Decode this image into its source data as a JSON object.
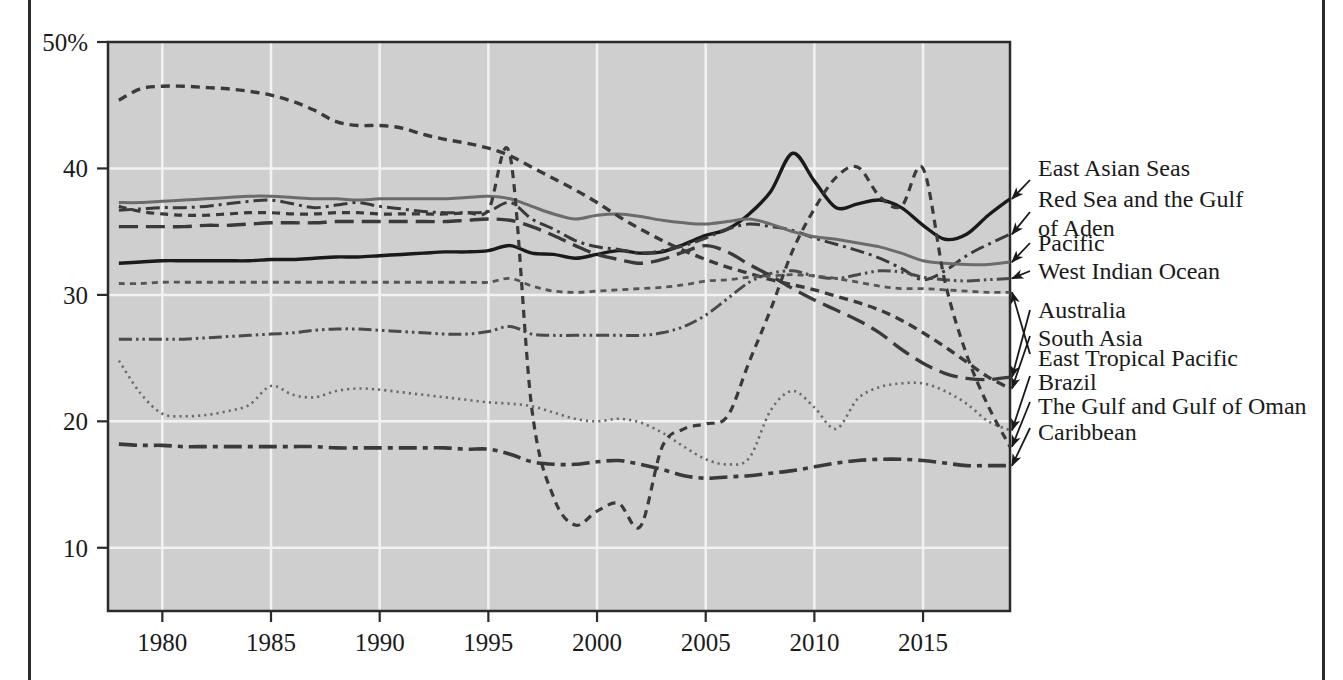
{
  "chart_data": {
    "type": "line",
    "title": "",
    "xlabel": "",
    "ylabel": "",
    "xlim": [
      1977.5,
      2019.0
    ],
    "ylim": [
      5.0,
      50.0
    ],
    "grid": true,
    "legend_position": "right-labels-with-arrows",
    "y_ticks": [
      {
        "value": 50,
        "label": "50%"
      },
      {
        "value": 40,
        "label": "40"
      },
      {
        "value": 30,
        "label": "30"
      },
      {
        "value": 20,
        "label": "20"
      },
      {
        "value": 10,
        "label": "10"
      }
    ],
    "x_ticks": [
      {
        "value": 1980,
        "label": "1980"
      },
      {
        "value": 1985,
        "label": "1985"
      },
      {
        "value": 1990,
        "label": "1990"
      },
      {
        "value": 1995,
        "label": "1995"
      },
      {
        "value": 2000,
        "label": "2000"
      },
      {
        "value": 2005,
        "label": "2005"
      },
      {
        "value": 2010,
        "label": "2010"
      },
      {
        "value": 2015,
        "label": "2015"
      }
    ],
    "x": [
      1978,
      1979,
      1980,
      1981,
      1982,
      1983,
      1984,
      1985,
      1986,
      1987,
      1988,
      1989,
      1990,
      1991,
      1992,
      1993,
      1994,
      1995,
      1996,
      1997,
      1998,
      1999,
      2000,
      2001,
      2002,
      2003,
      2004,
      2005,
      2006,
      2007,
      2008,
      2009,
      2010,
      2011,
      2012,
      2013,
      2014,
      2015,
      2016,
      2017,
      2018,
      2019
    ],
    "series": [
      {
        "name": "East Asian Seas",
        "style": "solid-black",
        "color": "#1a1a1a",
        "values": [
          32.5,
          32.6,
          32.7,
          32.7,
          32.7,
          32.7,
          32.7,
          32.8,
          32.8,
          32.9,
          33.0,
          33.0,
          33.1,
          33.2,
          33.3,
          33.4,
          33.4,
          33.5,
          33.9,
          33.3,
          33.2,
          32.9,
          33.2,
          33.5,
          33.3,
          33.4,
          34.0,
          34.7,
          35.2,
          36.4,
          38.2,
          41.2,
          39.0,
          36.9,
          37.2,
          37.5,
          36.9,
          35.5,
          34.4,
          34.8,
          36.3,
          37.6
        ]
      },
      {
        "name": "Red Sea and the Gulf of Aden",
        "style": "dash-dot",
        "color": "#3a3a3a",
        "values": [
          36.7,
          36.8,
          36.9,
          36.9,
          37.0,
          37.2,
          37.4,
          37.5,
          37.2,
          36.9,
          37.1,
          37.3,
          37.0,
          36.8,
          36.6,
          36.5,
          36.5,
          36.6,
          37.3,
          36.0,
          35.2,
          34.3,
          33.8,
          33.6,
          33.3,
          33.5,
          33.9,
          34.5,
          35.2,
          35.6,
          35.4,
          35.1,
          34.5,
          34.0,
          33.5,
          32.9,
          32.1,
          31.2,
          31.9,
          33.1,
          34.0,
          34.8
        ]
      },
      {
        "name": "Pacific",
        "style": "solid-gray",
        "color": "#6b6b6b",
        "values": [
          37.3,
          37.3,
          37.4,
          37.5,
          37.6,
          37.7,
          37.8,
          37.8,
          37.7,
          37.6,
          37.6,
          37.5,
          37.6,
          37.6,
          37.6,
          37.6,
          37.7,
          37.8,
          37.6,
          37.0,
          36.4,
          36.0,
          36.3,
          36.4,
          36.2,
          35.9,
          35.7,
          35.6,
          35.8,
          36.0,
          35.6,
          35.0,
          34.6,
          34.4,
          34.1,
          33.8,
          33.3,
          32.7,
          32.5,
          32.4,
          32.4,
          32.6
        ]
      },
      {
        "name": "West Indian Ocean",
        "style": "dash-dot-dot",
        "color": "#4a4a4a",
        "values": [
          26.5,
          26.5,
          26.5,
          26.5,
          26.6,
          26.7,
          26.8,
          26.9,
          27.0,
          27.2,
          27.3,
          27.3,
          27.2,
          27.1,
          27.0,
          26.9,
          26.9,
          27.1,
          27.5,
          26.9,
          26.8,
          26.8,
          26.8,
          26.8,
          26.8,
          27.0,
          27.5,
          28.4,
          29.7,
          31.0,
          31.7,
          31.9,
          31.5,
          31.3,
          31.6,
          31.9,
          31.8,
          31.4,
          31.2,
          31.1,
          31.2,
          31.3
        ]
      },
      {
        "name": "Australia",
        "style": "long-dash",
        "color": "#3a3a3a",
        "values": [
          35.4,
          35.4,
          35.4,
          35.4,
          35.5,
          35.5,
          35.6,
          35.7,
          35.7,
          35.7,
          35.8,
          35.8,
          35.8,
          35.8,
          35.8,
          35.8,
          35.9,
          36.0,
          35.9,
          35.4,
          34.7,
          33.9,
          33.2,
          32.8,
          32.5,
          32.8,
          33.4,
          33.9,
          33.4,
          32.4,
          31.5,
          30.5,
          29.6,
          28.8,
          28.0,
          27.0,
          25.7,
          24.6,
          23.8,
          23.4,
          23.3,
          23.5
        ]
      },
      {
        "name": "South Asia",
        "style": "short-dash",
        "color": "#3a3a3a",
        "values": [
          45.4,
          46.3,
          46.5,
          46.5,
          46.4,
          46.3,
          46.1,
          45.8,
          45.3,
          44.6,
          43.7,
          43.4,
          43.4,
          43.2,
          42.7,
          42.3,
          42.0,
          41.6,
          41.0,
          40.1,
          39.2,
          38.3,
          37.3,
          36.2,
          35.2,
          34.3,
          33.5,
          32.8,
          32.2,
          31.7,
          31.2,
          30.8,
          30.4,
          29.9,
          29.4,
          28.8,
          28.0,
          27.0,
          25.9,
          24.7,
          23.5,
          22.6
        ]
      },
      {
        "name": "East Tropical Pacific",
        "style": "fine-dash",
        "color": "#555555",
        "values": [
          30.9,
          30.9,
          31.0,
          31.0,
          31.0,
          31.0,
          31.0,
          31.0,
          31.0,
          31.0,
          31.0,
          31.0,
          31.0,
          31.0,
          31.0,
          31.0,
          31.0,
          31.0,
          31.3,
          30.7,
          30.3,
          30.2,
          30.3,
          30.4,
          30.5,
          30.6,
          30.8,
          31.1,
          31.2,
          31.4,
          31.5,
          31.6,
          31.5,
          31.3,
          31.0,
          30.7,
          30.5,
          30.5,
          30.4,
          30.3,
          30.2,
          30.2
        ]
      },
      {
        "name": "Brazil",
        "style": "dotted",
        "color": "#6b6b6b",
        "values": [
          24.8,
          22.2,
          20.6,
          20.4,
          20.5,
          20.8,
          21.3,
          22.8,
          22.1,
          21.9,
          22.4,
          22.6,
          22.5,
          22.3,
          22.1,
          21.9,
          21.7,
          21.5,
          21.4,
          21.2,
          20.7,
          20.2,
          20.0,
          20.2,
          19.9,
          19.1,
          18.0,
          17.0,
          16.6,
          17.1,
          20.9,
          22.4,
          21.1,
          19.4,
          21.8,
          22.7,
          23.0,
          23.0,
          22.4,
          21.4,
          20.0,
          19.3
        ]
      },
      {
        "name": "The Gulf and Gulf of Oman",
        "style": "medium-dash",
        "color": "#3a3a3a",
        "values": [
          37.0,
          36.6,
          36.4,
          36.3,
          36.3,
          36.4,
          36.5,
          36.5,
          36.4,
          36.4,
          36.5,
          36.5,
          36.4,
          36.4,
          36.4,
          36.4,
          36.5,
          36.7,
          41.0,
          21.0,
          14.0,
          11.8,
          12.9,
          13.5,
          11.7,
          18.0,
          19.4,
          19.8,
          20.4,
          24.7,
          28.9,
          33.5,
          36.8,
          39.3,
          40.1,
          37.8,
          37.0,
          40.0,
          31.1,
          25.3,
          21.2,
          18.0
        ]
      },
      {
        "name": "Caribbean",
        "style": "wide-dash-dot",
        "color": "#3a3a3a",
        "values": [
          18.2,
          18.1,
          18.1,
          18.0,
          18.0,
          18.0,
          18.0,
          18.0,
          18.0,
          18.0,
          17.9,
          17.9,
          17.9,
          17.9,
          17.9,
          17.9,
          17.8,
          17.8,
          17.4,
          16.8,
          16.6,
          16.6,
          16.8,
          16.9,
          16.6,
          16.2,
          15.7,
          15.5,
          15.6,
          15.7,
          15.9,
          16.1,
          16.4,
          16.7,
          16.9,
          17.0,
          17.0,
          16.9,
          16.7,
          16.5,
          16.5,
          16.5
        ]
      }
    ]
  },
  "legend": {
    "items": [
      {
        "label": "East Asian Seas",
        "label2": ""
      },
      {
        "label": "Red Sea and the Gulf",
        "label2": "of Aden"
      },
      {
        "label": "Pacific",
        "label2": ""
      },
      {
        "label": "West Indian Ocean",
        "label2": ""
      },
      {
        "label": "Australia",
        "label2": ""
      },
      {
        "label": "South Asia",
        "label2": ""
      },
      {
        "label": "East Tropical Pacific",
        "label2": ""
      },
      {
        "label": "Brazil",
        "label2": ""
      },
      {
        "label": "The Gulf and Gulf of Oman",
        "label2": ""
      },
      {
        "label": "Caribbean",
        "label2": ""
      }
    ]
  },
  "colors": {
    "plot_background": "#cfcfcf",
    "gridline": "#f2f2f2",
    "axis": "#2b2b2b",
    "page_rule": "#2b2b2b"
  }
}
